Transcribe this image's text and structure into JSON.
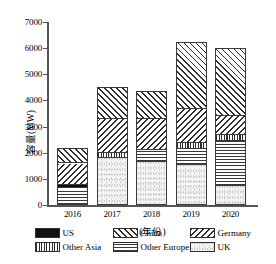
{
  "chart_data": {
    "type": "bar",
    "stacked": true,
    "title": "",
    "xlabel": "(年份)",
    "ylabel": "容量(MW)",
    "categories": [
      "2016",
      "2017",
      "2018",
      "2019",
      "2020"
    ],
    "ylim": [
      0,
      7000
    ],
    "ytick_step": 1000,
    "yticks": [
      "0",
      "1000",
      "2000",
      "3000",
      "4000",
      "5000",
      "6000",
      "7000"
    ],
    "grid": false,
    "legend_position": "bottom",
    "series": [
      {
        "name": "UK",
        "key": "uk",
        "pattern": "light-dotted",
        "values": [
          0,
          1750,
          1600,
          1500,
          700
        ]
      },
      {
        "name": "Other Europe",
        "key": "othereurope",
        "pattern": "horizontal-stripes",
        "values": [
          600,
          0,
          450,
          600,
          1700
        ]
      },
      {
        "name": "Other Asia",
        "key": "otherasia",
        "pattern": "vertical-stripes",
        "values": [
          0,
          200,
          0,
          250,
          250
        ]
      },
      {
        "name": "US",
        "key": "us",
        "pattern": "solid-black",
        "values": [
          110,
          0,
          0,
          0,
          0
        ]
      },
      {
        "name": "Germany",
        "key": "germany",
        "pattern": "backslash-hatch",
        "values": [
          840,
          1300,
          1200,
          1300,
          700
        ]
      },
      {
        "name": "China",
        "key": "china",
        "pattern": "forwardslash-hatch",
        "values": [
          650,
          1250,
          1100,
          2600,
          2650
        ]
      }
    ],
    "totals": [
      2200,
      4500,
      4350,
      6250,
      6000
    ]
  },
  "legend": {
    "items": [
      {
        "label": "US",
        "key": "us"
      },
      {
        "label": "China",
        "key": "china"
      },
      {
        "label": "Germany",
        "key": "germany"
      },
      {
        "label": "Other Asia",
        "key": "otherasia"
      },
      {
        "label": "Other Europe",
        "key": "othereurope"
      },
      {
        "label": "UK",
        "key": "uk"
      }
    ]
  }
}
